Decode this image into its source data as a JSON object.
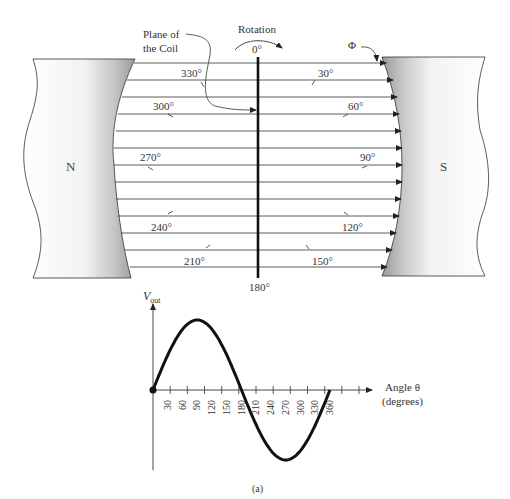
{
  "labels": {
    "plane_of_coil_line1": "Plane of",
    "plane_of_coil_line2": "the Coil",
    "rotation": "Rotation",
    "flux": "Φ",
    "north_pole": "N",
    "south_pole": "S",
    "caption": "(a)"
  },
  "coil_angles": {
    "top": "0°",
    "bottom": "180°",
    "left": [
      "330°",
      "300°",
      "270°",
      "240°",
      "210°"
    ],
    "right": [
      "30°",
      "60°",
      "90°",
      "120°",
      "150°"
    ]
  },
  "graph": {
    "y_label_main": "V",
    "y_label_sub": "out",
    "x_label_line1": "Angle θ",
    "x_label_line2": "(degrees)",
    "ticks": [
      "30",
      "60",
      "90",
      "120",
      "150",
      "180",
      "210",
      "240",
      "270",
      "300",
      "330",
      "360"
    ]
  },
  "chart_data": {
    "type": "line",
    "title": "",
    "xlabel": "Angle θ (degrees)",
    "ylabel": "Vout",
    "x": [
      0,
      30,
      60,
      90,
      120,
      150,
      180,
      210,
      240,
      270,
      300,
      330,
      360
    ],
    "series": [
      {
        "name": "Vout (sine)",
        "values": [
          0,
          0.5,
          0.866,
          1,
          0.866,
          0.5,
          0,
          -0.5,
          -0.866,
          -1,
          -0.866,
          -0.5,
          0
        ]
      }
    ],
    "xlim": [
      0,
      360
    ],
    "ylim": [
      -1,
      1
    ],
    "grid": false,
    "legend": "none"
  }
}
